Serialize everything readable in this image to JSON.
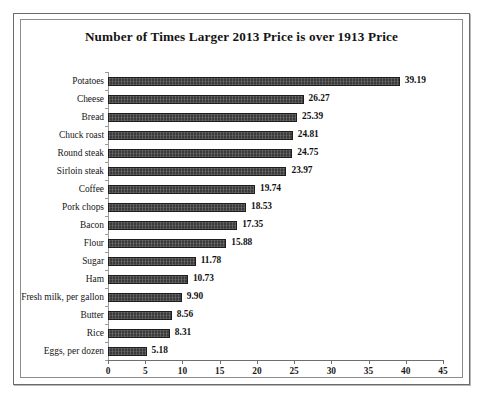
{
  "figure": {
    "title": "Number of Times Larger 2013 Price is over 1913 Price",
    "frame_color": "#6a6a6a",
    "bar_color": "#3b3b3b",
    "background": "#ffffff"
  },
  "chart_data": {
    "type": "bar",
    "orientation": "horizontal",
    "title": "Number of Times Larger 2013 Price is over 1913 Price",
    "xlabel": "",
    "ylabel": "",
    "xlim": [
      0,
      45
    ],
    "xticks": [
      "0",
      "5",
      "10",
      "15",
      "20",
      "25",
      "30",
      "35",
      "40",
      "45"
    ],
    "grid": false,
    "legend": false,
    "data_labels": true,
    "categories": [
      "Potatoes",
      "Cheese",
      "Bread",
      "Chuck roast",
      "Round steak",
      "Sirloin steak",
      "Coffee",
      "Pork chops",
      "Bacon",
      "Flour",
      "Sugar",
      "Ham",
      "Fresh milk, per gallon",
      "Butter",
      "Rice",
      "Eggs, per dozen"
    ],
    "values": [
      39.19,
      26.27,
      25.39,
      24.81,
      24.75,
      23.97,
      19.74,
      18.53,
      17.35,
      15.88,
      11.78,
      10.73,
      9.9,
      8.56,
      8.31,
      5.18
    ],
    "value_labels": [
      "39.19",
      "26.27",
      "25.39",
      "24.81",
      "24.75",
      "23.97",
      "19.74",
      "18.53",
      "17.35",
      "15.88",
      "11.78",
      "10.73",
      "9.90",
      "8.56",
      "8.31",
      "5.18"
    ]
  }
}
